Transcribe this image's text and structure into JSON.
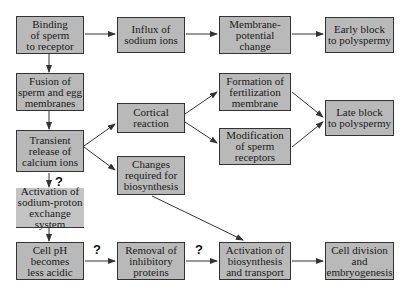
{
  "nodes": {
    "binding": "Binding\nof sperm\nto receptor",
    "influx": "Influx of\nsodium ions",
    "membrane_potential": "Membrane-\npotential\nchange",
    "early_block": "Early block\nto polyspermy",
    "fusion": "Fusion of\nsperm and egg\nmembranes",
    "formation": "Formation of\nfertilization\nmembrane",
    "cortical": "Cortical\nreaction",
    "late_block": "Late block\nto polyspermy",
    "transient": "Transient\nrelease of\ncalcium ions",
    "modification": "Modification\nof sperm\nreceptors",
    "changes": "Changes\nrequired for\nbiosynthesis",
    "activation_na": "Activation of\nsodium-proton\nexchange system",
    "cell_ph": "Cell pH\nbecomes\nless acidic",
    "removal": "Removal of\ninhibitory\nproteins",
    "activation_bio": "Activation of\nbiosynthesis\nand transport",
    "cell_division": "Cell division\nand\nembryogenesis"
  },
  "question_marks": {
    "q1": "?",
    "q2": "?",
    "q3": "?"
  },
  "colors": {
    "box_fill": "#b9b9b9",
    "border": "#333333",
    "arrow": "#333333"
  }
}
